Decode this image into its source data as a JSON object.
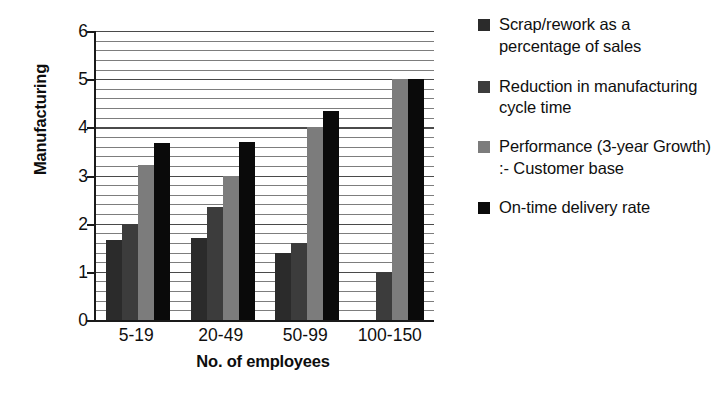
{
  "chart_data": {
    "type": "bar",
    "title": "",
    "xlabel": "No. of employees",
    "ylabel": "Manufacturing",
    "categories": [
      "5-19",
      "20-49",
      "50-99",
      "100-150"
    ],
    "ylim": [
      0,
      6
    ],
    "yticks": [
      0,
      1,
      2,
      3,
      4,
      5,
      6
    ],
    "grid": true,
    "grid_orientation": "horizontal",
    "legend_position": "right",
    "series": [
      {
        "name": "Scrap/rework as a percentage of sales",
        "color": "#2b2b2b",
        "values": [
          1.67,
          1.7,
          1.4,
          0
        ]
      },
      {
        "name": "Reduction in manufacturing cycle time",
        "color": "#3c3c3c",
        "values": [
          2.0,
          2.35,
          1.6,
          1.0
        ]
      },
      {
        "name": "Performance (3-year Growth) :- Customer base",
        "color": "#7c7c7c",
        "values": [
          3.22,
          3.0,
          4.0,
          5.0
        ]
      },
      {
        "name": "On-time delivery rate",
        "color": "#0a0a0a",
        "values": [
          3.67,
          3.7,
          4.33,
          5.0
        ]
      }
    ]
  },
  "axes": {
    "y_title": "Manufacturing",
    "x_title": "No. of employees",
    "y_tick_labels": [
      "6",
      "5",
      "4",
      "3",
      "2",
      "1",
      "0"
    ],
    "x_tick_labels": [
      "5-19",
      "20-49",
      "50-99",
      "100-150"
    ]
  },
  "legend": {
    "entries": [
      {
        "label": "Scrap/rework as a percentage of sales",
        "color": "#2b2b2b"
      },
      {
        "label": "Reduction in manufacturing cycle time",
        "color": "#3c3c3c"
      },
      {
        "label": "Performance (3-year Growth) :- Customer base",
        "color": "#7c7c7c"
      },
      {
        "label": "On-time delivery rate",
        "color": "#0a0a0a"
      }
    ]
  }
}
